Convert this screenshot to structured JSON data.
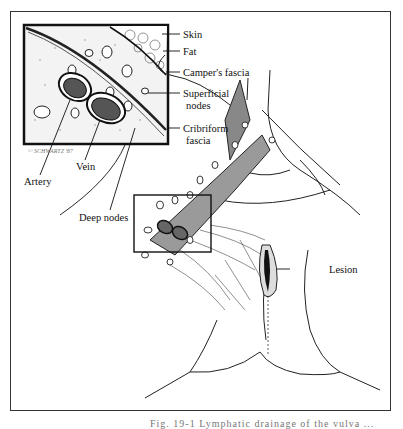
{
  "figure": {
    "labels": {
      "skin": "Skin",
      "fat": "Fat",
      "campers_fascia": "Camper's fascia",
      "superficial_nodes_1": "Superficial",
      "superficial_nodes_2": "nodes",
      "cribriform_fascia_1": "Cribriform",
      "cribriform_fascia_2": "fascia",
      "vein": "Vein",
      "artery": "Artery",
      "deep_nodes": "Deep nodes",
      "lesion": "Lesion"
    },
    "signature": "© SCHWARTZ '87",
    "caption": "Fig. 19-1  Lymphatic drainage of the vulva ..."
  }
}
